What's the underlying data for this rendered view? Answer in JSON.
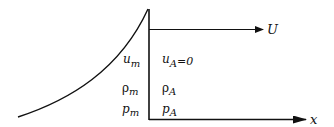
{
  "diagram": {
    "colors": {
      "line": "#111111",
      "background": "#ffffff"
    },
    "labels": {
      "velocity_arrow": "U",
      "x_axis": "x"
    },
    "left_state": [
      {
        "symbol": "u",
        "subscript": "m"
      },
      {
        "symbol": "ρ",
        "subscript": "m"
      },
      {
        "symbol": "p",
        "subscript": "m"
      }
    ],
    "right_state": [
      {
        "symbol": "u",
        "subscript": "A",
        "suffix": "=0"
      },
      {
        "symbol": "ρ",
        "subscript": "A",
        "suffix": ""
      },
      {
        "symbol": "p",
        "subscript": "A",
        "suffix": ""
      }
    ]
  }
}
